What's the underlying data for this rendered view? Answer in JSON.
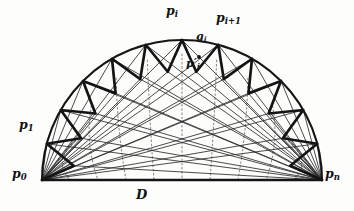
{
  "figure": {
    "labels": {
      "p0": "p",
      "p0_sub": "0",
      "pn": "p",
      "pn_sub": "n",
      "p1": "p",
      "p1_sub": "1",
      "pi": "p",
      "pi_sub": "i",
      "pi1": "p",
      "pi1_sub": "i+1",
      "qi": "q",
      "qi_sub": "i",
      "pip": "p",
      "pip_prime": "′",
      "pip_sub": "i",
      "D": "D"
    },
    "colors": {
      "ink": "#111111",
      "bold_stroke": "#141414",
      "thin_stroke": "#2a2a2a",
      "dotted_stroke": "#8d8d8d",
      "background": "#fdfdfc"
    },
    "geometry": {
      "p0": [
        42,
        180
      ],
      "pn": [
        322,
        180
      ],
      "center": [
        182,
        180
      ],
      "radius": 140,
      "arc_segments": 12,
      "baseline_label": "D",
      "inner_radius_ratio": 0.78,
      "fan_lines_per_endpoint": 10,
      "dotted_curve_count": 9
    },
    "points": [
      {
        "name": "p0",
        "x": 42,
        "y": 180,
        "on_arc": true,
        "labeled": true
      },
      {
        "name": "p1",
        "x": 48,
        "y": 134,
        "on_arc": true,
        "labeled": true
      },
      {
        "name": "pi",
        "x": 177,
        "y": 39,
        "on_arc": true,
        "labeled": true
      },
      {
        "name": "pi+1",
        "x": 233,
        "y": 46,
        "on_arc": true,
        "labeled": true
      },
      {
        "name": "qi",
        "x": 206,
        "y": 44,
        "on_arc": false,
        "labeled": true
      },
      {
        "name": "pi'",
        "x": 199,
        "y": 57,
        "on_arc": false,
        "labeled": true,
        "marker": true
      },
      {
        "name": "pn",
        "x": 322,
        "y": 180,
        "on_arc": true,
        "labeled": true
      }
    ],
    "strokes": {
      "arc_width": 2.0,
      "baseline_width": 2.6,
      "zigzag_width": 2.6,
      "fan_width": 0.85,
      "dotted_width": 1.1,
      "dotted_dash": "1.6 2.6"
    }
  }
}
